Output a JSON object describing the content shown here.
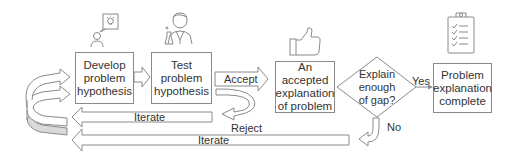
{
  "diagram": {
    "steps": [
      {
        "id": "develop",
        "label_lines": [
          "Develop",
          "problem",
          "hypothesis"
        ],
        "icon": "person-idea-icon"
      },
      {
        "id": "test",
        "label_lines": [
          "Test",
          "problem",
          "hypothesis"
        ],
        "icon": "scientist-icon"
      },
      {
        "id": "accepted",
        "label_lines": [
          "An accepted",
          "explanation",
          "of problem"
        ],
        "icon": "thumbs-up-icon"
      },
      {
        "id": "complete",
        "label_lines": [
          "Problem",
          "explanation",
          "complete"
        ],
        "icon": "clipboard-checklist-icon"
      }
    ],
    "decision": {
      "label_lines": [
        "Explain",
        "enough",
        "of gap?"
      ]
    },
    "edges": {
      "accept": "Accept",
      "reject": "Reject",
      "yes": "Yes",
      "no": "No",
      "iterate_inner": "Iterate",
      "iterate_outer": "Iterate"
    },
    "colors": {
      "stroke": "#8a8a8a",
      "text": "#333333",
      "shaded": "#d9d9d9",
      "background": "#ffffff"
    }
  }
}
